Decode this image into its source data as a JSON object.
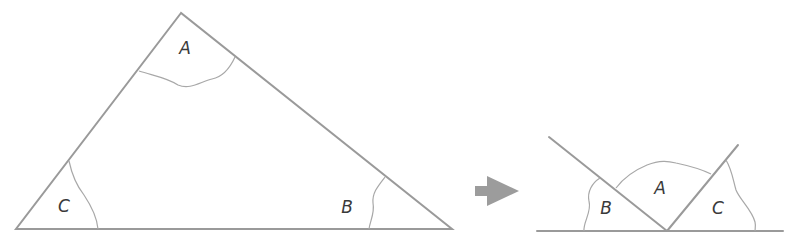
{
  "figure": {
    "original_triangle": {
      "labels": {
        "A": "A",
        "B": "B",
        "C": "C"
      }
    },
    "rearranged": {
      "labels": {
        "A": "A",
        "B": "B",
        "C": "C"
      }
    },
    "arrow": {
      "icon": "right-arrow-icon",
      "color": "#999999"
    },
    "colors": {
      "lines": "#9a9a9a",
      "text": "#3a3a3a",
      "background": "#ffffff"
    }
  }
}
